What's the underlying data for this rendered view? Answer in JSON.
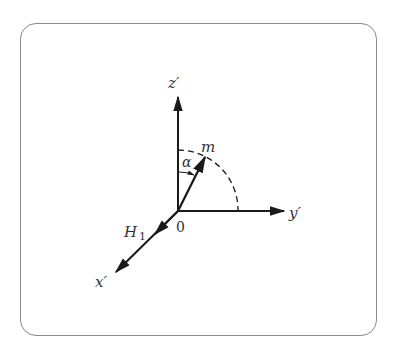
{
  "diagram": {
    "type": "coordinate-axes",
    "labels": {
      "z_axis": "z′",
      "y_axis": "y′",
      "x_axis": "x′",
      "vector": "m",
      "angle": "α",
      "field": "H",
      "field_subscript": "1",
      "origin": "0"
    },
    "colors": {
      "stroke": "#1a1a1a",
      "frame": "#8a8a8a",
      "text": "#333333"
    }
  }
}
